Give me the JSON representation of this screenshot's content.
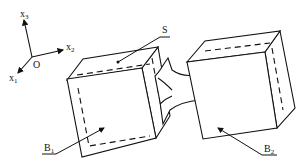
{
  "diagram": {
    "type": "mechanical-schematic",
    "axes": {
      "origin_label": "O",
      "x1": {
        "base": "x",
        "sub": "1"
      },
      "x2": {
        "base": "x",
        "sub": "2"
      },
      "x3": {
        "base": "x",
        "sub": "3"
      }
    },
    "labels": {
      "surface": "S",
      "body1": {
        "base": "B",
        "sub": "1"
      },
      "body2": {
        "base": "B",
        "sub": "2"
      }
    },
    "colors": {
      "stroke": "#111111",
      "background": "#ffffff"
    }
  }
}
